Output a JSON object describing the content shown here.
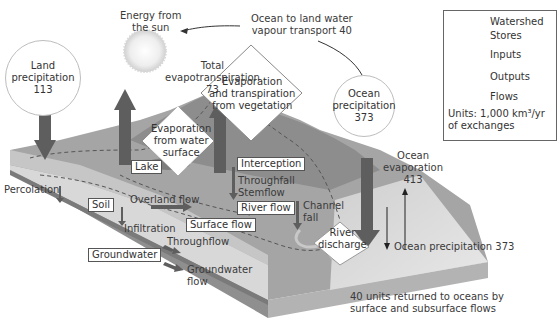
{
  "diagram": {
    "sun_label": [
      "Energy from",
      "the sun"
    ],
    "ocean_to_land": [
      "Ocean to land water",
      "vapour transport 40"
    ],
    "land_precipitation": {
      "label": [
        "Land",
        "precipitation"
      ],
      "value": "113"
    },
    "ocean_precipitation_circle": {
      "label": [
        "Ocean",
        "precipitation"
      ],
      "value": "373"
    },
    "total_evapotranspiration": {
      "label": [
        "Total",
        "evapotranspiration"
      ],
      "value": "73"
    },
    "outputs": {
      "evap_transpiration_vegetation": [
        "Evaporation",
        "and transpiration",
        "from vegetation"
      ],
      "evap_water_surface": [
        "Evaporation",
        "from water",
        "surface"
      ],
      "river_discharge": [
        "River",
        "discharge"
      ]
    },
    "stores": {
      "lake": "Lake",
      "interception": "Interception",
      "soil": "Soil",
      "river_flow": "River flow",
      "surface_flow": "Surface flow",
      "groundwater": "Groundwater"
    },
    "flows": {
      "percolation": "Percolation",
      "overland_flow": "Overland flow",
      "infiltration": "Infiltration",
      "throughflow": "Throughflow",
      "groundwater_flow": [
        "Groundwater",
        "flow"
      ],
      "throughfall": "Throughfall",
      "stemflow": "Stemflow",
      "channel_fall": [
        "Channel",
        "fall"
      ]
    },
    "ocean_evaporation": {
      "label": [
        "Ocean",
        "evaporation"
      ],
      "value": "413"
    },
    "ocean_precipitation_line": "Ocean precipitation 373",
    "return_note": [
      "40 units returned to oceans by",
      "surface and subsurface flows"
    ]
  },
  "legend": {
    "items": [
      {
        "symbol": "dashed-line",
        "label": "Watershed"
      },
      {
        "symbol": "rectangle",
        "label": "Stores"
      },
      {
        "symbol": "circle",
        "label": "Inputs"
      },
      {
        "symbol": "diamond",
        "label": "Outputs"
      },
      {
        "symbol": "arrow",
        "label": "Flows"
      }
    ],
    "units": [
      "Units: 1,000 km³/yr",
      "of exchanges"
    ]
  },
  "colors": {
    "arrow": "#5e5e5e",
    "land_top": "#9a9a9a",
    "land_dark": "#7a7a7a",
    "soil_layer": "#bdbdbd",
    "block_side": "#a8a8a8",
    "ocean": "#d6d6d6"
  }
}
